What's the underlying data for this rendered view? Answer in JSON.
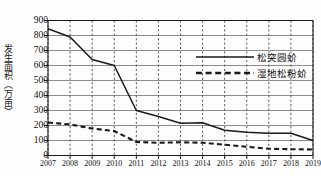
{
  "chart_data": {
    "type": "line",
    "title": "",
    "xlabel": "",
    "ylabel": "发生面积（万亩）",
    "categories": [
      "2007",
      "2008",
      "2009",
      "2010",
      "2011",
      "2012",
      "2013",
      "2014",
      "2015",
      "2016",
      "2017",
      "2018",
      "2019"
    ],
    "ylim": [
      0,
      900
    ],
    "ytick_step": 100,
    "yticks": [
      "0",
      "100",
      "200",
      "300",
      "400",
      "500",
      "600",
      "700",
      "800",
      "900"
    ],
    "grid": "horizontal-solid-and-vertical-dashed",
    "legend_position": "upper-right-inside",
    "series": [
      {
        "name": "松突圆蚧",
        "style": "solid",
        "color": "#1a1a1a",
        "values": [
          845,
          790,
          640,
          600,
          300,
          260,
          215,
          218,
          168,
          155,
          148,
          148,
          100
        ]
      },
      {
        "name": "湿地松粉蚧",
        "style": "dashed",
        "color": "#1a1a1a",
        "values": [
          220,
          207,
          180,
          163,
          90,
          85,
          88,
          85,
          72,
          58,
          45,
          42,
          40
        ]
      }
    ]
  },
  "legend": {
    "items": [
      {
        "label": "松突圆蚧",
        "style": "solid"
      },
      {
        "label": "湿地松粉蚧",
        "style": "dashed"
      }
    ]
  }
}
